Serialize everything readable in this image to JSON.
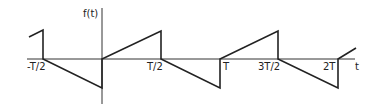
{
  "diagram": {
    "type": "sawtooth-waveform",
    "y_axis_label": "f(t)",
    "x_axis_label": "t",
    "tick_labels": [
      "-T/2",
      "T/2",
      "T",
      "3T/2",
      "2T"
    ],
    "line_color": "#222222",
    "axis_color": "#333333"
  }
}
